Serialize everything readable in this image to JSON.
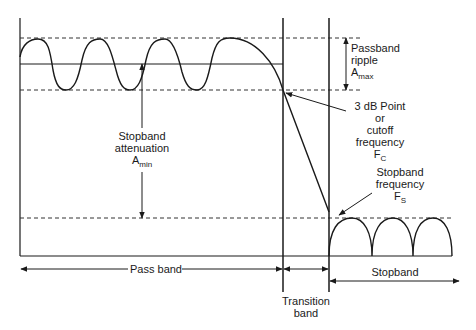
{
  "labels": {
    "passband_ripple": {
      "line1": "Passband",
      "line2": "ripple",
      "base": "A",
      "sub": "max"
    },
    "stopband_attenuation": {
      "line1": "Stopband",
      "line2": "attenuation",
      "base": "A",
      "sub": "min"
    },
    "cutoff": {
      "line1": "3 dB Point",
      "line2": "or",
      "line3": "cutoff",
      "line4": "frequency",
      "base": "F",
      "sub": "C"
    },
    "stopband_frequency": {
      "line1": "Stopband",
      "line2": "frequency",
      "base": "F",
      "sub": "S"
    },
    "pass_band": "Pass band",
    "transition_band": {
      "line1": "Transition",
      "line2": "band"
    },
    "stopband": "Stopband"
  },
  "colors": {
    "line": "#1a1a1a",
    "dashed": "#333333",
    "background": "#ffffff"
  }
}
